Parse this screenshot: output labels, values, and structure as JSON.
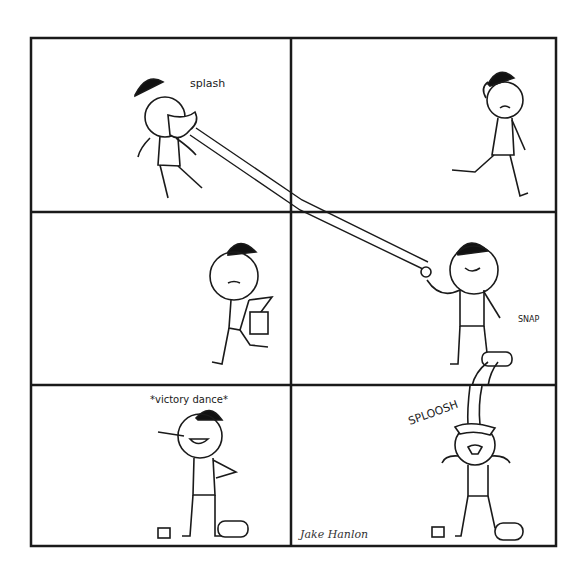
{
  "comic": {
    "layout": {
      "rows": 3,
      "cols": 2,
      "border_color": "#1a1a1a",
      "background": "#ffffff"
    },
    "panels": [
      {
        "id": 1,
        "caption": "splash",
        "description": "Stick figure with bowler hat gets splashed in the face by a long stream of water"
      },
      {
        "id": 2,
        "caption": "",
        "description": "Wet, annoyed stick figure walks off scratching his head"
      },
      {
        "id": 3,
        "caption": "",
        "description": "Stick figure walks carrying a bucket/bag"
      },
      {
        "id": 4,
        "caption": "SNAP",
        "description": "Smug stick figure holds the stream while snapping fingers; a can above tips over"
      },
      {
        "id": 5,
        "caption": "*victory dance*",
        "description": "Stick figure points up happily beside a knocked-over can"
      },
      {
        "id": 6,
        "caption": "SPLOOSH",
        "description": "Stick figure gets drenched by water pouring from above"
      }
    ],
    "signature": "Jake Hanlon"
  }
}
